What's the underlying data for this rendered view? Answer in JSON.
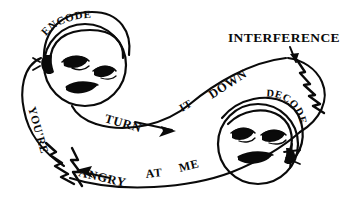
{
  "figure": {
    "background_color": "#ffffff",
    "ink_color": "#0a0a0a",
    "width": 353,
    "height": 216
  },
  "labels": {
    "interference": "INTERFERENCE",
    "encode": "ENCODE",
    "decode": "DECODE",
    "message_outbound": "TURN IT DOWN",
    "message_outbound_words": [
      "TURN",
      "IT",
      "DOWN"
    ],
    "message_return": "YOU'RE ANGRY AT ME",
    "message_return_words": [
      "YOU'RE",
      "ANGRY",
      "AT",
      "ME"
    ]
  },
  "faces": {
    "left": {
      "name": "encoder-face",
      "band_label": "ENCODE"
    },
    "right": {
      "name": "decoder-face",
      "band_label": "DECODE"
    }
  },
  "icons": {
    "interference_arrow": "arrow-down-icon",
    "outbound_arrow": "arrow-right-icon",
    "return_arrow": "arrow-left-icon",
    "noise_right": "lightning-bolt-icon",
    "noise_left": "lightning-bolt-icon"
  }
}
